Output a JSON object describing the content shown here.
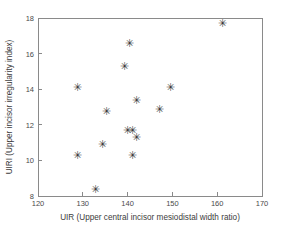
{
  "chart_data": {
    "type": "scatter",
    "title": "",
    "xlabel": "UIR (Upper central incisor mesiodistal width ratio)",
    "ylabel": "UIRI (Upper incisor irregularity index)",
    "xlim": [
      120,
      170
    ],
    "ylim": [
      8,
      18
    ],
    "xticks": [
      120,
      130,
      140,
      150,
      160,
      170
    ],
    "yticks": [
      8,
      10,
      12,
      14,
      16,
      18
    ],
    "xtick_labels": [
      "120",
      "130",
      "140",
      "150",
      "160",
      "170"
    ],
    "ytick_labels": [
      "8",
      "10",
      "12",
      "14",
      "16",
      "18"
    ],
    "grid": false,
    "legend": false,
    "marker": "asterisk",
    "marker_glyph": "✳",
    "marker_color": "#3a3a3a",
    "axis_color": "#8a8a8a",
    "background": "#ffffff",
    "points": [
      {
        "x": 161.1,
        "y": 17.7
      },
      {
        "x": 140.5,
        "y": 16.6
      },
      {
        "x": 139.2,
        "y": 15.3
      },
      {
        "x": 128.9,
        "y": 14.1
      },
      {
        "x": 149.5,
        "y": 14.1
      },
      {
        "x": 141.9,
        "y": 13.4
      },
      {
        "x": 147.2,
        "y": 12.9
      },
      {
        "x": 135.4,
        "y": 12.8
      },
      {
        "x": 139.9,
        "y": 11.7
      },
      {
        "x": 141.0,
        "y": 11.7
      },
      {
        "x": 141.9,
        "y": 11.3
      },
      {
        "x": 134.5,
        "y": 10.9
      },
      {
        "x": 141.0,
        "y": 10.3
      },
      {
        "x": 128.9,
        "y": 10.3
      },
      {
        "x": 132.9,
        "y": 8.4
      }
    ]
  }
}
